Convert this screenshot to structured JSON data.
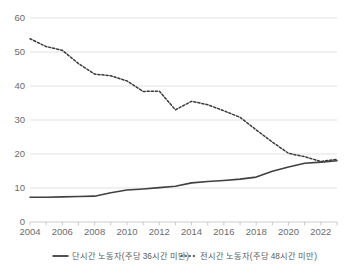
{
  "chart_data": {
    "type": "line",
    "title": "",
    "xlabel": "",
    "ylabel": "",
    "ylim": [
      0,
      60
    ],
    "xlim": [
      2004,
      2023
    ],
    "grid": true,
    "legend_position": "bottom",
    "y_ticks": [
      "0",
      "10",
      "20",
      "30",
      "40",
      "50",
      "60"
    ],
    "x_ticks": [
      "2004",
      "2006",
      "2008",
      "2010",
      "2012",
      "2014",
      "2016",
      "2018",
      "2020",
      "2022"
    ],
    "x_all_years": [
      2004,
      2005,
      2006,
      2007,
      2008,
      2009,
      2010,
      2011,
      2012,
      2013,
      2014,
      2015,
      2016,
      2017,
      2018,
      2019,
      2020,
      2021,
      2022,
      2023
    ],
    "series": [
      {
        "name": "단시간 노동자(주당 36시간 미만)",
        "style": "solid",
        "color": "#404040",
        "values": [
          7.3,
          7.3,
          7.4,
          7.5,
          7.6,
          8.6,
          9.4,
          9.7,
          10.1,
          10.5,
          11.5,
          11.9,
          12.2,
          12.6,
          13.2,
          14.9,
          16.2,
          17.3,
          17.6,
          18.0
        ]
      },
      {
        "name": "전시간 노동자(주당 48시간 미만)",
        "style": "dotted",
        "color": "#3a3a3a",
        "values": [
          53.9,
          51.6,
          50.5,
          46.6,
          43.5,
          43.0,
          41.5,
          38.4,
          38.5,
          33.0,
          35.5,
          34.5,
          32.7,
          30.8,
          27.1,
          23.5,
          20.2,
          19.2,
          17.8,
          18.4
        ]
      }
    ]
  },
  "legend": {
    "items": [
      {
        "label": "단시간 노동자(주당 36시간 미만)",
        "style": "solid"
      },
      {
        "label": "전시간 노동자(주당 48시간 미만)",
        "style": "dotted"
      }
    ]
  },
  "colors": {
    "gridline": "#d9d9d9",
    "axis": "#bfbfbf",
    "text": "#6b6b6b",
    "series_solid": "#404040",
    "series_dotted": "#3a3a3a",
    "background": "#ffffff"
  }
}
